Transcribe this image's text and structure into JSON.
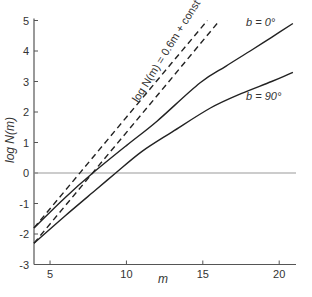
{
  "chart_data": {
    "type": "line",
    "title": "",
    "xlabel": "m",
    "ylabel": "log N(m)",
    "xlim": [
      3.95,
      21.1
    ],
    "ylim": [
      -3,
      5
    ],
    "x_ticks": [
      5,
      10,
      15,
      20
    ],
    "x_tick_labels": [
      "5",
      "10",
      "15",
      "20"
    ],
    "y_ticks": [
      5,
      4,
      3,
      2,
      1,
      0,
      -1,
      -2,
      -3
    ],
    "y_tick_labels": [
      "5",
      "4",
      "3",
      "2",
      "1",
      "0",
      "-1",
      "-2",
      "-3"
    ],
    "grid": false,
    "reference_line_y": 0,
    "series": [
      {
        "name": "log N(m) = 0.6m + const (upper)",
        "style": "dashed",
        "x": [
          3.95,
          7.0,
          10.0,
          13.0,
          15.3
        ],
        "values": [
          -1.8,
          0.03,
          1.83,
          3.63,
          5.0
        ]
      },
      {
        "name": "log N(m) = 0.6m + const (lower)",
        "style": "dashed",
        "x": [
          3.95,
          8.0,
          12.0,
          16.1
        ],
        "values": [
          -2.3,
          0.13,
          2.53,
          5.0
        ]
      },
      {
        "name": "b = 0°",
        "style": "solid",
        "x": [
          3.95,
          6.0,
          7.8,
          10.0,
          12.0,
          14.8,
          16.5,
          18.1,
          19.5,
          20.9
        ],
        "values": [
          -1.8,
          -0.8,
          0.0,
          0.9,
          1.7,
          2.95,
          3.5,
          4.0,
          4.45,
          4.9
        ]
      },
      {
        "name": "b = 90°",
        "style": "solid",
        "x": [
          3.95,
          6.0,
          8.0,
          9.3,
          11.0,
          13.0,
          15.5,
          17.5,
          19.5,
          20.9
        ],
        "values": [
          -2.3,
          -1.4,
          -0.55,
          0.0,
          0.7,
          1.35,
          2.13,
          2.6,
          3.0,
          3.3
        ]
      }
    ],
    "annotations": [
      {
        "text": "log N(m) = 0.6m + const",
        "rotated": true
      },
      {
        "text": "b = 0°",
        "near_series": "b = 0°"
      },
      {
        "text": "b = 90°",
        "near_series": "b = 90°"
      }
    ]
  },
  "labels": {
    "xlabel": "m",
    "ylabel": "log N(m)",
    "dashed_annotation": "log N(m) = 0.6m + const",
    "b0": "b = 0°",
    "b90": "b = 90°"
  },
  "colors": {
    "line": "#222222",
    "axis": "#555555",
    "zero_line": "#999999"
  }
}
